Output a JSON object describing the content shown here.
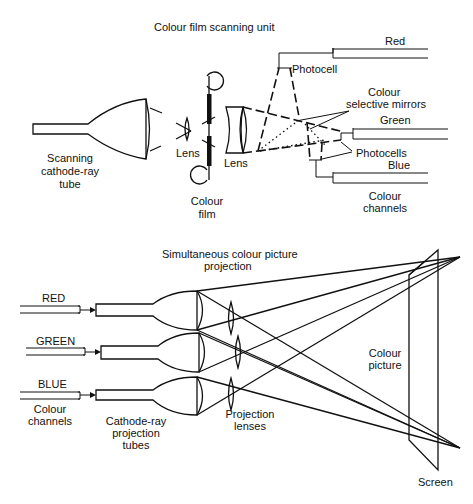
{
  "scanning_unit": {
    "title": "Colour film scanning unit",
    "labels": {
      "tube": [
        "Scanning",
        "cathode-ray",
        "tube"
      ],
      "lens1": "Lens",
      "lens2": "Lens",
      "film": [
        "Colour",
        "film"
      ],
      "photocell": "Photocell",
      "mirrors": [
        "Colour",
        "selective mirrors"
      ],
      "photocells": "Photocells",
      "channels": [
        "Colour",
        "channels"
      ],
      "red": "Red",
      "green": "Green",
      "blue": "Blue"
    }
  },
  "projection": {
    "title": [
      "Simultaneous colour picture",
      "projection"
    ],
    "labels": {
      "red": "RED",
      "green": "GREEN",
      "blue": "BLUE",
      "channels": [
        "Colour",
        "channels"
      ],
      "tubes": [
        "Cathode-ray",
        "projection",
        "tubes"
      ],
      "lenses": [
        "Projection",
        "lenses"
      ],
      "picture": [
        "Colour",
        "picture"
      ],
      "screen": "Screen"
    }
  }
}
